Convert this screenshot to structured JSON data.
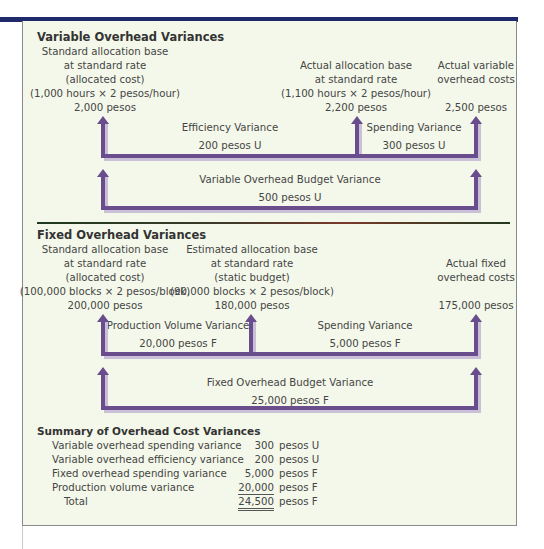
{
  "variable": {
    "title": "Variable Overhead Variances",
    "col1": [
      "Standard allocation base",
      "at standard rate",
      "(allocated cost)",
      "(1,000 hours × 2 pesos/hour)",
      "2,000 pesos"
    ],
    "col2": [
      "Actual allocation base",
      "at standard rate",
      "(1,100 hours × 2 pesos/hour)",
      "2,200 pesos"
    ],
    "col3": [
      "Actual variable",
      "overhead costs",
      "2,500 pesos"
    ],
    "efficiency": {
      "label": "Efficiency Variance",
      "value": "200  pesos U"
    },
    "spending": {
      "label": "Spending Variance",
      "value": "300 pesos U"
    },
    "budget": {
      "label": "Variable Overhead Budget Variance",
      "value": "500 pesos U"
    }
  },
  "fixed": {
    "title": "Fixed Overhead Variances",
    "col1": [
      "Standard allocation base",
      "at standard rate",
      "(allocated cost)",
      "(100,000 blocks × 2 pesos/block)",
      "200,000 pesos"
    ],
    "col2": [
      "Estimated allocation base",
      "at standard rate",
      "(static budget)",
      "(90,000 blocks × 2 pesos/block)",
      "180,000 pesos"
    ],
    "col3": [
      "Actual fixed",
      "overhead costs",
      "175,000 pesos"
    ],
    "volume": {
      "label": "Production Volume Variance",
      "value": "20,000 pesos F"
    },
    "spending": {
      "label": "Spending Variance",
      "value": "5,000 pesos F"
    },
    "budget": {
      "label": "Fixed Overhead Budget Variance",
      "value": "25,000 pesos F"
    }
  },
  "summary": {
    "title": "Summary of Overhead Cost Variances",
    "rows": [
      {
        "label": "Variable overhead spending variance",
        "amount": "300",
        "unit": "pesos U"
      },
      {
        "label": "Variable overhead efficiency variance",
        "amount": "200",
        "unit": "pesos U"
      },
      {
        "label": "Fixed overhead spending variance",
        "amount": "5,000",
        "unit": "pesos F"
      },
      {
        "label": "Production volume variance",
        "amount": "20,000",
        "unit": "pesos F"
      },
      {
        "label": "Total",
        "amount": "24,500",
        "unit": "pesos F"
      }
    ]
  },
  "colors": {
    "arrow": "#6a4d8c",
    "arrow_shadow": "#c9bfd6",
    "topbar": "#1f2a6b",
    "panel": "#f4f8ea"
  }
}
